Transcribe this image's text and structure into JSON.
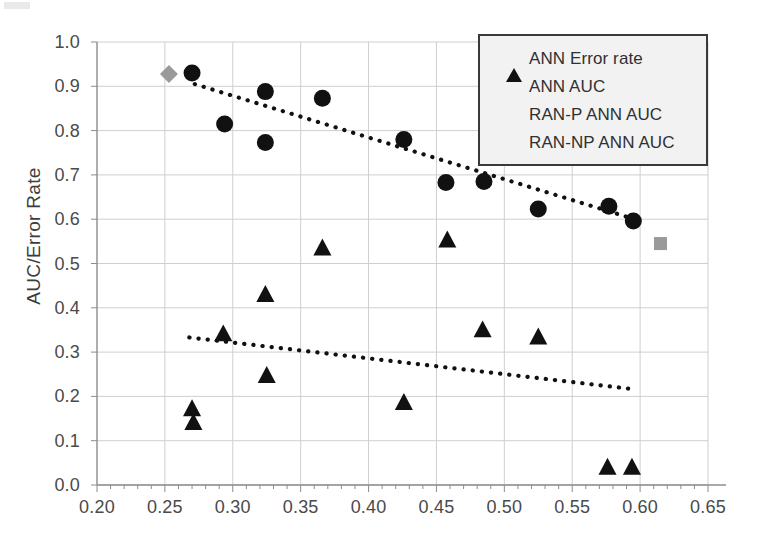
{
  "chart_data": {
    "type": "scatter",
    "title": "",
    "xlabel": "",
    "ylabel": "AUC/Error Rate",
    "xlim": [
      0.2,
      0.65
    ],
    "ylim": [
      0.0,
      1.0
    ],
    "xticks": [
      "0.20",
      "0.25",
      "0.30",
      "0.35",
      "0.40",
      "0.45",
      "0.50",
      "0.55",
      "0.60",
      "0.65"
    ],
    "xtick_values": [
      0.2,
      0.25,
      0.3,
      0.35,
      0.4,
      0.45,
      0.5,
      0.55,
      0.6,
      0.65
    ],
    "yticks": [
      "0.0",
      "0.1",
      "0.2",
      "0.3",
      "0.4",
      "0.5",
      "0.6",
      "0.7",
      "0.8",
      "0.9",
      "1.0"
    ],
    "ytick_values": [
      0.0,
      0.1,
      0.2,
      0.3,
      0.4,
      0.5,
      0.6,
      0.7,
      0.8,
      0.9,
      1.0
    ],
    "grid": true,
    "legend_position": "top-right",
    "series": [
      {
        "name": "ANN Error rate",
        "marker": "triangle",
        "color": "#111111",
        "points": [
          {
            "x": 0.27,
            "y": 0.172
          },
          {
            "x": 0.271,
            "y": 0.141
          },
          {
            "x": 0.293,
            "y": 0.341
          },
          {
            "x": 0.324,
            "y": 0.43
          },
          {
            "x": 0.325,
            "y": 0.247
          },
          {
            "x": 0.366,
            "y": 0.535
          },
          {
            "x": 0.426,
            "y": 0.186
          },
          {
            "x": 0.458,
            "y": 0.553
          },
          {
            "x": 0.484,
            "y": 0.35
          },
          {
            "x": 0.525,
            "y": 0.334
          },
          {
            "x": 0.576,
            "y": 0.04
          },
          {
            "x": 0.594,
            "y": 0.04
          }
        ]
      },
      {
        "name": "ANN AUC",
        "marker": "circle",
        "color": "#111111",
        "points": [
          {
            "x": 0.27,
            "y": 0.93
          },
          {
            "x": 0.294,
            "y": 0.815
          },
          {
            "x": 0.324,
            "y": 0.888
          },
          {
            "x": 0.324,
            "y": 0.773
          },
          {
            "x": 0.366,
            "y": 0.873
          },
          {
            "x": 0.426,
            "y": 0.78
          },
          {
            "x": 0.457,
            "y": 0.683
          },
          {
            "x": 0.485,
            "y": 0.685
          },
          {
            "x": 0.525,
            "y": 0.623
          },
          {
            "x": 0.577,
            "y": 0.629
          },
          {
            "x": 0.595,
            "y": 0.596
          }
        ]
      },
      {
        "name": "RAN-P ANN AUC",
        "marker": "diamond",
        "color": "#9a9a9a",
        "points": [
          {
            "x": 0.253,
            "y": 0.928
          }
        ]
      },
      {
        "name": "RAN-NP ANN AUC",
        "marker": "square",
        "color": "#9a9a9a",
        "points": [
          {
            "x": 0.615,
            "y": 0.545
          }
        ]
      }
    ],
    "trendlines": [
      {
        "name": "ANN AUC trendline",
        "style": "dotted",
        "color": "#111111",
        "x0": 0.272,
        "y0": 0.905,
        "x1": 0.596,
        "y1": 0.6
      },
      {
        "name": "ANN Error rate trendline",
        "style": "dotted",
        "color": "#111111",
        "x0": 0.268,
        "y0": 0.333,
        "x1": 0.596,
        "y1": 0.216
      }
    ]
  },
  "legend": {
    "entries": [
      {
        "label": "ANN Error rate",
        "marker": "triangle"
      },
      {
        "label": "ANN AUC",
        "marker": "circle"
      },
      {
        "label": "RAN-P ANN AUC",
        "marker": "diamond"
      },
      {
        "label": "RAN-NP ANN AUC",
        "marker": "square"
      }
    ]
  },
  "colors": {
    "marker_dark": "#111111",
    "marker_gray": "#9a9a9a",
    "grid": "#cfcfcf",
    "axis": "#8c8c8c",
    "legend_border": "#3a3a3a",
    "legend_fill": "#f2f2f2"
  }
}
